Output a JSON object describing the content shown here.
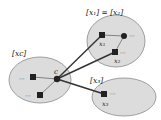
{
  "diagram": {
    "classes": [
      {
        "id": "xc",
        "label": "[xc]"
      },
      {
        "id": "x1x2",
        "label": "[x₁] = [x₂]"
      },
      {
        "id": "x3",
        "label": "[x₃]"
      }
    ],
    "nodes": {
      "c": "c",
      "x1": "x₁",
      "x2": "x₂",
      "x3": "x₃"
    },
    "ellipsis": "···",
    "colors": {
      "ellipse_fill": "#dcdcdc",
      "ellipse_stroke": "#8a8a8a",
      "node": "#222222",
      "edge": "#333333"
    }
  }
}
